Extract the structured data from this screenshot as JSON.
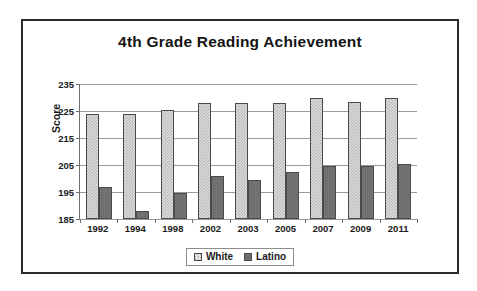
{
  "chart_data": {
    "type": "bar",
    "title": "4th Grade Reading Achievement",
    "xlabel": "",
    "ylabel": "Score",
    "categories": [
      "1992",
      "1994",
      "1998",
      "2002",
      "2003",
      "2005",
      "2007",
      "2009",
      "2011"
    ],
    "series": [
      {
        "name": "White",
        "color": "#dcdcdc",
        "values": [
          224,
          224,
          225.5,
          228,
          228,
          228,
          230,
          228.5,
          230
        ]
      },
      {
        "name": "Latino",
        "color": "#6e6e6e",
        "values": [
          197,
          188,
          194.5,
          201,
          199.5,
          202.5,
          204.5,
          204.5,
          205.5
        ]
      }
    ],
    "ylim": [
      185,
      235
    ],
    "ytick_step": 10,
    "yticks": [
      "235",
      "225",
      "215",
      "205",
      "195",
      "185"
    ],
    "grid": true,
    "legend_position": "bottom"
  },
  "legend": {
    "items": [
      {
        "label": "White",
        "swatch": "white-pattern-swatch"
      },
      {
        "label": "Latino",
        "swatch": "latino-solid-swatch"
      }
    ]
  }
}
